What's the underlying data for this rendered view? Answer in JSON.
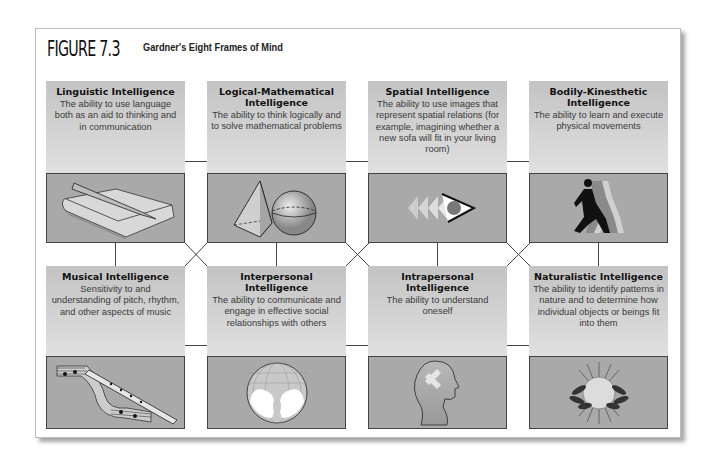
{
  "figure": {
    "label": "FIGURE 7.3",
    "title": "Gardner's Eight Frames of Mind"
  },
  "colors": {
    "text_panel": "#cfcfcf",
    "image_panel": "#a9a9a9",
    "border": "#444444"
  },
  "intelligences": [
    {
      "title": "Linguistic Intelligence",
      "description": "The ability to use language both as an aid to thinking and in communication",
      "icon": "book-and-pencil-icon"
    },
    {
      "title": "Logical-Mathematical Intelligence",
      "description": "The ability to think logically and to solve mathematical problems",
      "icon": "pyramid-and-sphere-icon"
    },
    {
      "title": "Spatial Intelligence",
      "description": "The ability to use images that represent spatial relations (for example, imagining whether a new sofa will fit in your living room)",
      "icon": "eye-icon"
    },
    {
      "title": "Bodily-Kinesthetic Intelligence",
      "description": "The ability to learn and execute physical movements",
      "icon": "runner-icon"
    },
    {
      "title": "Musical Intelligence",
      "description": "Sensitivity to and understanding of pitch, rhythm, and other aspects of music",
      "icon": "flute-and-sheet-music-icon"
    },
    {
      "title": "Interpersonal Intelligence",
      "description": "The ability to communicate and engage in effective social relationships with others",
      "icon": "two-faces-globe-icon"
    },
    {
      "title": "Intrapersonal Intelligence",
      "description": "The ability to understand oneself",
      "icon": "head-profile-icon"
    },
    {
      "title": "Naturalistic Intelligence",
      "description": "The ability to identify patterns in nature and to determine how individual objects or beings fit into them",
      "icon": "sun-and-leaves-icon"
    }
  ]
}
